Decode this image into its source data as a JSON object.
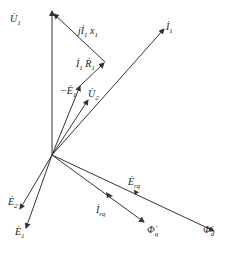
{
  "diagram": {
    "origin": [
      52,
      155
    ],
    "colors": {
      "line": "#333333",
      "text": "#222222",
      "background": "#ffffff"
    },
    "vectors": [
      {
        "id": "U1",
        "label": "U",
        "sub": "1",
        "from": [
          52,
          155
        ],
        "to": [
          52,
          10
        ],
        "label_pos": [
          10,
          21
        ]
      },
      {
        "id": "jI1x1",
        "label": "jI",
        "sub": "1",
        "suffix": "x",
        "suffix_sub": "1",
        "from": [
          105,
          62
        ],
        "to": [
          54,
          14
        ],
        "label_pos": [
          80,
          33
        ]
      },
      {
        "id": "I1R1",
        "label": "I",
        "sub": "1",
        "suffix": "R",
        "suffix_sub": "1",
        "from": [
          80,
          85
        ],
        "to": [
          105,
          62
        ],
        "label_pos": [
          76,
          66
        ]
      },
      {
        "id": "negE1",
        "label": "-E",
        "sub": "1",
        "from": [
          52,
          155
        ],
        "to": [
          80,
          85
        ],
        "label_pos": [
          62,
          92
        ]
      },
      {
        "id": "U2",
        "label": "U",
        "sub": "2",
        "from": [
          52,
          155
        ],
        "to": [
          88,
          100
        ],
        "label_pos": [
          88,
          97
        ]
      },
      {
        "id": "I1",
        "label": "I",
        "sub": "1",
        "from": [
          52,
          155
        ],
        "to": [
          165,
          28
        ],
        "label_pos": [
          166,
          28
        ]
      },
      {
        "id": "E2",
        "label": "E",
        "sub": "2",
        "from": [
          52,
          155
        ],
        "to": [
          20,
          210
        ],
        "label_pos": [
          8,
          204
        ]
      },
      {
        "id": "E1",
        "label": "E",
        "sub": "1",
        "from": [
          52,
          155
        ],
        "to": [
          26,
          229
        ],
        "label_pos": [
          15,
          234
        ]
      },
      {
        "id": "Erq",
        "label": "E",
        "sub": "rq",
        "from": [
          52,
          155
        ],
        "to": [
          215,
          232
        ],
        "label_pos": [
          130,
          186
        ],
        "mid_arrow": [
          133,
          188
        ]
      },
      {
        "id": "Irq",
        "label": "I",
        "sub": "rq",
        "from": [
          52,
          155
        ],
        "to": [
          145,
          223
        ],
        "label_pos": [
          97,
          214
        ],
        "mid_arrow": [
          110,
          196
        ]
      },
      {
        "id": "Phiq",
        "label": "Φ",
        "sub": "q",
        "from": [
          52,
          155
        ],
        "to": [
          145,
          223
        ],
        "label_pos": [
          148,
          234
        ]
      },
      {
        "id": "Phid",
        "label": "Φ",
        "sub": "d",
        "from": [
          52,
          155
        ],
        "to": [
          215,
          232
        ],
        "label_pos": [
          202,
          234
        ]
      }
    ]
  }
}
